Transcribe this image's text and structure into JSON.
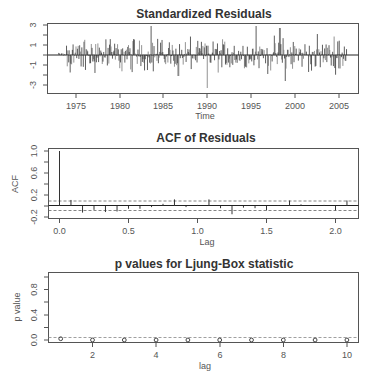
{
  "chart_data": [
    {
      "type": "bar",
      "title": "Standardized Residuals",
      "xlabel": "Time",
      "ylabel": "",
      "xlim": [
        1971.2,
        2007.2
      ],
      "ylim": [
        -3.3,
        3.2
      ],
      "x_ticks": [
        1975,
        1980,
        1985,
        1990,
        1995,
        2000,
        2005
      ],
      "y_ticks": [
        -3,
        -1,
        1,
        3
      ],
      "series_start": 1973.0,
      "series_end": 2005.9,
      "frequency": 12,
      "notable_points": [
        {
          "x": 1983.6,
          "y": 2.9
        },
        {
          "x": 1990.0,
          "y": -3.3
        },
        {
          "x": 1995.6,
          "y": 2.9
        },
        {
          "x": 1998.3,
          "y": 2.7
        },
        {
          "x": 1998.9,
          "y": -2.6
        },
        {
          "x": 1986.7,
          "y": -2.1
        }
      ],
      "grid": false
    },
    {
      "type": "bar",
      "title": "ACF of Residuals",
      "xlabel": "Lag",
      "ylabel": "ACF",
      "xlim": [
        -0.09,
        2.16
      ],
      "ylim": [
        -0.22,
        1.05
      ],
      "x_ticks": [
        0.0,
        0.5,
        1.0,
        1.5,
        2.0
      ],
      "y_ticks": [
        -0.2,
        0.2,
        0.6,
        1.0
      ],
      "x": [
        0.0,
        0.083,
        0.167,
        0.25,
        0.333,
        0.417,
        0.5,
        0.583,
        0.667,
        0.75,
        0.833,
        0.917,
        1.0,
        1.083,
        1.167,
        1.25,
        1.333,
        1.417,
        1.5,
        1.583,
        1.667,
        1.75,
        1.833,
        1.917,
        2.0,
        2.083
      ],
      "values": [
        1.0,
        0.11,
        -0.12,
        -0.07,
        -0.11,
        -0.1,
        -0.05,
        -0.05,
        -0.02,
        0.04,
        0.12,
        -0.02,
        0.02,
        0.12,
        -0.04,
        -0.15,
        -0.03,
        -0.04,
        -0.08,
        0.01,
        0.1,
        0.03,
        0.01,
        0.02,
        -0.08,
        0.1
      ],
      "confidence_bound": 0.085,
      "grid": false
    },
    {
      "type": "scatter",
      "title": "p values for Ljung-Box statistic",
      "xlabel": "lag",
      "ylabel": "p value",
      "xlim": [
        0.6,
        10.4
      ],
      "ylim": [
        -0.02,
        1.02
      ],
      "x_ticks": [
        2,
        4,
        6,
        8,
        10
      ],
      "y_ticks": [
        0.0,
        0.4,
        0.8
      ],
      "x": [
        1,
        2,
        3,
        4,
        5,
        6,
        7,
        8,
        9,
        10
      ],
      "values": [
        0.02,
        0.0,
        0.0,
        0.0,
        0.0,
        0.0,
        0.0,
        0.0,
        0.0,
        0.0
      ],
      "reference_line": 0.05,
      "grid": false
    }
  ],
  "panels": {
    "residuals": {
      "title": "Standardized Residuals",
      "xlabel": "Time",
      "x_tick_labels": [
        "1975",
        "1980",
        "1985",
        "1990",
        "1995",
        "2000",
        "2005"
      ],
      "y_tick_labels": [
        "3",
        "1",
        "-1",
        "-3"
      ]
    },
    "acf": {
      "title": "ACF of Residuals",
      "xlabel": "Lag",
      "ylabel": "ACF",
      "x_tick_labels": [
        "0.0",
        "0.5",
        "1.0",
        "1.5",
        "2.0"
      ],
      "y_tick_labels": [
        "1.0",
        "0.6",
        "0.2",
        "-0.2"
      ]
    },
    "ljung": {
      "title": "p values for Ljung-Box statistic",
      "xlabel": "lag",
      "ylabel": "p value",
      "x_tick_labels": [
        "2",
        "4",
        "6",
        "8",
        "10"
      ],
      "y_tick_labels": [
        "0.8",
        "0.4",
        "0.0"
      ]
    }
  }
}
